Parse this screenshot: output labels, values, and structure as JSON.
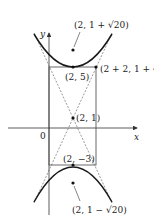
{
  "diagram": {
    "type": "hyperbola-with-asymptotes",
    "axes": {
      "x_label": "x",
      "y_label": "y",
      "origin_label": "0"
    },
    "points": {
      "upper_focus": "(2, 1 + √20)",
      "upper_vertex": "(2, 5)",
      "corner": "(2 + 2, 1 + 4)",
      "center": "(2, 1)",
      "lower_vertex": "(2, −3)",
      "lower_focus": "(2, 1 − √20)"
    },
    "colors": {
      "curve": "#1a1a1a",
      "axis": "#333333",
      "box": "#444444",
      "asymptote": "#555555"
    }
  }
}
